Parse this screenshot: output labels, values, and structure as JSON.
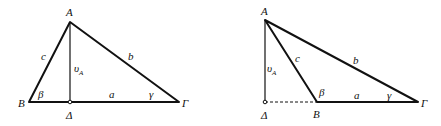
{
  "figures": [
    {
      "id": "acute",
      "vertices": {
        "A": {
          "label": "A",
          "x": 70,
          "y": 22
        },
        "B": {
          "label": "B",
          "x": 29,
          "y": 102
        },
        "G": {
          "label": "Γ",
          "x": 179,
          "y": 102
        },
        "D": {
          "label": "Δ",
          "x": 70,
          "y": 102
        }
      },
      "sides": {
        "a": "a",
        "b": "b",
        "c": "c"
      },
      "angles": {
        "beta": "β",
        "gamma": "γ"
      },
      "altitude": {
        "label": "υ",
        "subscript": "A"
      }
    },
    {
      "id": "obtuse",
      "vertices": {
        "A": {
          "label": "A",
          "x": 265,
          "y": 20
        },
        "B": {
          "label": "B",
          "x": 317,
          "y": 102
        },
        "G": {
          "label": "Γ",
          "x": 418,
          "y": 102
        },
        "D": {
          "label": "Δ",
          "x": 265,
          "y": 102
        }
      },
      "sides": {
        "a": "a",
        "b": "b",
        "c": "c"
      },
      "angles": {
        "beta": "β",
        "gamma": "γ"
      },
      "altitude": {
        "label": "υ",
        "subscript": "A"
      }
    }
  ]
}
